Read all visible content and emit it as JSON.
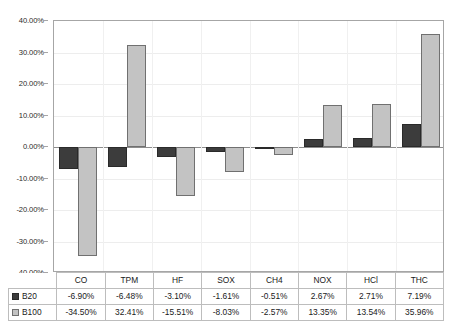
{
  "chart_data": {
    "type": "bar",
    "title": "",
    "xlabel": "",
    "ylabel": "",
    "ylim": [
      -40,
      40
    ],
    "ytick_step": 10,
    "grid": true,
    "legend_position": "table-bottom-left",
    "categories": [
      "CO",
      "TPM",
      "HF",
      "SOX",
      "CH4",
      "NOX",
      "HCl",
      "THC"
    ],
    "series": [
      {
        "name": "B20",
        "color": "#3c3c3c",
        "values": [
          -6.9,
          -6.48,
          -3.1,
          -1.61,
          -0.51,
          2.67,
          2.71,
          7.19
        ],
        "labels": [
          "-6.90%",
          "-6.48%",
          "-3.10%",
          "-1.61%",
          "-0.51%",
          "2.67%",
          "2.71%",
          "7.19%"
        ]
      },
      {
        "name": "B100",
        "color": "#c3c3c3",
        "values": [
          -34.5,
          32.41,
          -15.51,
          -8.03,
          -2.57,
          13.35,
          13.54,
          35.96
        ],
        "labels": [
          "-34.50%",
          "32.41%",
          "-15.51%",
          "-8.03%",
          "-2.57%",
          "13.35%",
          "13.54%",
          "35.96%"
        ]
      }
    ],
    "ytick_labels": [
      "40.00%",
      "30.00%",
      "20.00%",
      "10.00%",
      "0.00%",
      "-10.00%",
      "-20.00%",
      "-30.00%",
      "-40.00%"
    ],
    "ytick_values": [
      40,
      30,
      20,
      10,
      0,
      -10,
      -20,
      -30,
      -40
    ]
  }
}
